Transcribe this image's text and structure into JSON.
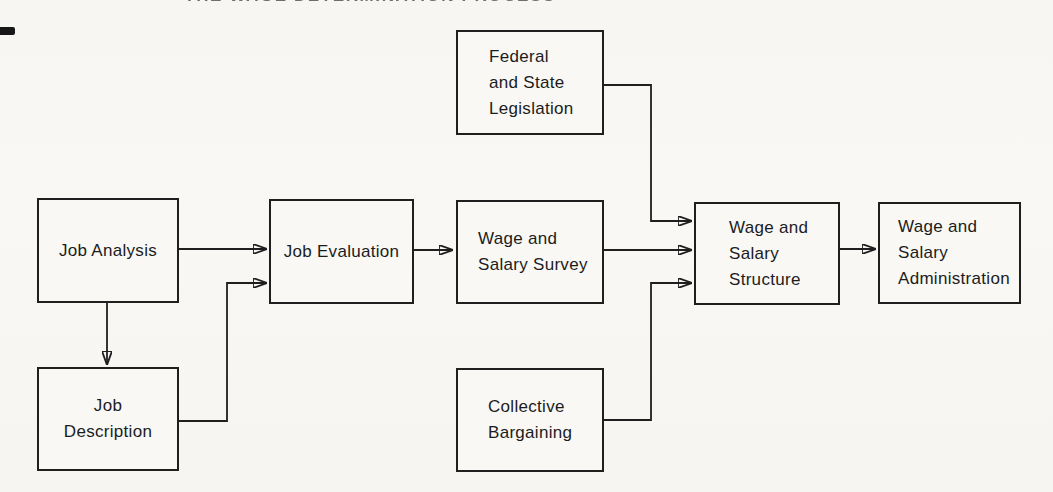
{
  "figure": {
    "title_fragment": "THE WAGE DETERMINATION PROCESS"
  },
  "diagram": {
    "type": "flowchart",
    "colors": {
      "background": "#f8f7f4",
      "line": "#1f1f1f",
      "box_border": "#1f1f1f",
      "text": "#1c1c1c"
    },
    "nodes": [
      {
        "id": "job-analysis",
        "label": "Job Analysis"
      },
      {
        "id": "job-description",
        "label": "Job\nDescription"
      },
      {
        "id": "job-evaluation",
        "label": "Job Evaluation"
      },
      {
        "id": "federal-state-legislation",
        "label": "Federal\nand State\nLegislation"
      },
      {
        "id": "wage-salary-survey",
        "label": "Wage and\nSalary Survey"
      },
      {
        "id": "collective-bargaining",
        "label": "Collective\nBargaining"
      },
      {
        "id": "wage-salary-structure",
        "label": "Wage and\nSalary\nStructure"
      },
      {
        "id": "wage-salary-administration",
        "label": "Wage and\nSalary\nAdministration"
      }
    ],
    "edges": [
      {
        "from": "job-analysis",
        "to": "job-evaluation"
      },
      {
        "from": "job-analysis",
        "to": "job-description"
      },
      {
        "from": "job-description",
        "to": "job-evaluation"
      },
      {
        "from": "job-evaluation",
        "to": "wage-salary-survey"
      },
      {
        "from": "federal-state-legislation",
        "to": "wage-salary-structure"
      },
      {
        "from": "wage-salary-survey",
        "to": "wage-salary-structure"
      },
      {
        "from": "collective-bargaining",
        "to": "wage-salary-structure"
      },
      {
        "from": "wage-salary-structure",
        "to": "wage-salary-administration"
      }
    ]
  }
}
